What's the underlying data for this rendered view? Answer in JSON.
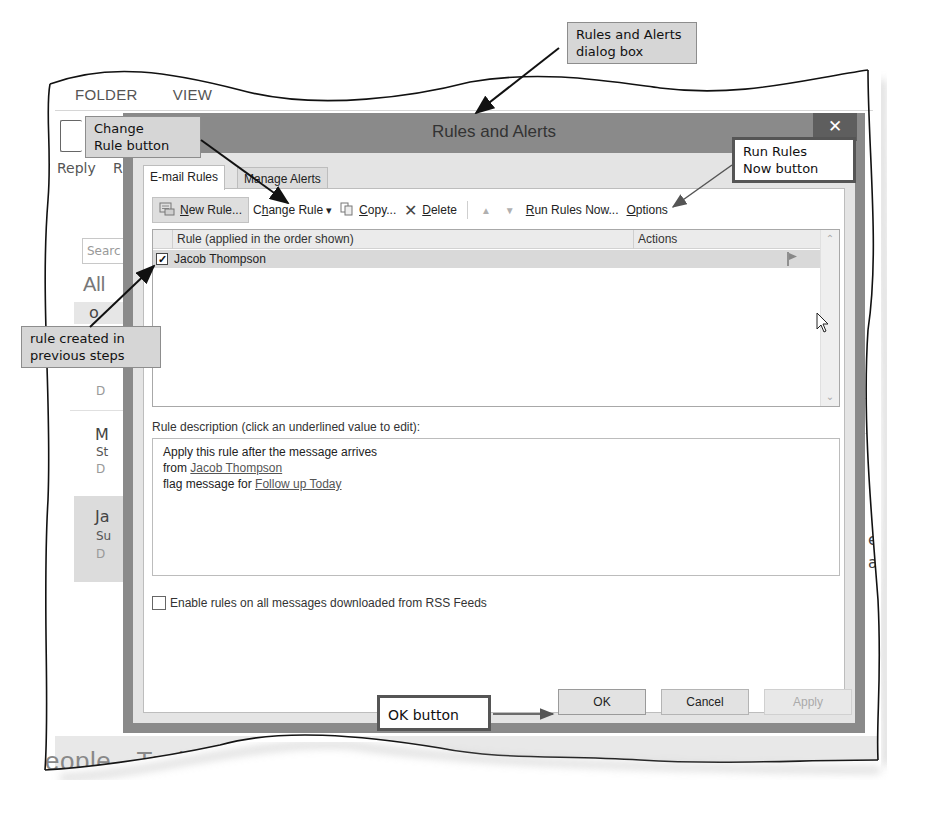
{
  "background_app": {
    "ribbon_tabs": [
      "FOLDER",
      "VIEW"
    ],
    "reply_label": "Reply",
    "reply_all_partial": "R",
    "search_placeholder": "Searc",
    "filter_all": "All",
    "list_items": [
      {
        "initial": "o",
        "date_partial": "D"
      },
      {
        "initial": "M",
        "subject_partial": "St",
        "date_partial": "D"
      },
      {
        "initial": "Ja",
        "subject_partial": "Su",
        "date_partial": "D",
        "selected": true
      }
    ],
    "reading_pane_fragments": [
      "pson",
      "ing",
      "er St",
      "am, v"
    ],
    "right_ribbon_labels": [
      "",
      "C",
      "F"
    ],
    "bottom_nav": [
      "eople",
      "Tasks",
      "•••"
    ]
  },
  "dialog": {
    "title": "Rules and Alerts",
    "close_glyph": "✕",
    "tabs": [
      {
        "label": "E-mail Rules",
        "active": true
      },
      {
        "label": "Manage Alerts",
        "active": false
      }
    ],
    "toolbar": {
      "new_rule": {
        "pre": "",
        "ul": "N",
        "post": "ew Rule..."
      },
      "change_rule": {
        "pre": "C",
        "ul": "h",
        "post": "ange Rule"
      },
      "copy": {
        "pre": "",
        "ul": "C",
        "post": "opy..."
      },
      "delete": {
        "pre": "",
        "ul": "D",
        "post": "elete"
      },
      "move_up": "▲",
      "move_down": "▼",
      "run_rules_now": {
        "pre": "",
        "ul": "R",
        "post": "un Rules Now..."
      },
      "options": {
        "pre": "",
        "ul": "O",
        "post": "ptions"
      },
      "dropdown_glyph": "▾"
    },
    "rules_list": {
      "columns": {
        "rule": "Rule (applied in the order shown)",
        "actions": "Actions"
      },
      "rows": [
        {
          "checked": true,
          "name": "Jacob Thompson",
          "action_icon": "flag-icon"
        }
      ],
      "scroll_up": "⌃",
      "scroll_down": "⌄"
    },
    "description": {
      "label": "Rule description (click an underlined value to edit):",
      "line1": "Apply this rule after the message arrives",
      "line2_prefix": "from ",
      "line2_link": "Jacob Thompson",
      "line3_prefix": "flag message for ",
      "line3_link": "Follow up Today"
    },
    "rss_checkbox": {
      "label": "Enable rules on all messages downloaded from RSS Feeds",
      "checked": false
    },
    "buttons": {
      "ok": "OK",
      "cancel": "Cancel",
      "apply": "Apply"
    }
  },
  "callouts": {
    "dialog_box": "Rules and Alerts\ndialog box",
    "change_rule": "Change\nRule button",
    "run_rules_now": "Run Rules\nNow button",
    "rule_created": "rule created in\nprevious steps",
    "ok_button": "OK button"
  }
}
